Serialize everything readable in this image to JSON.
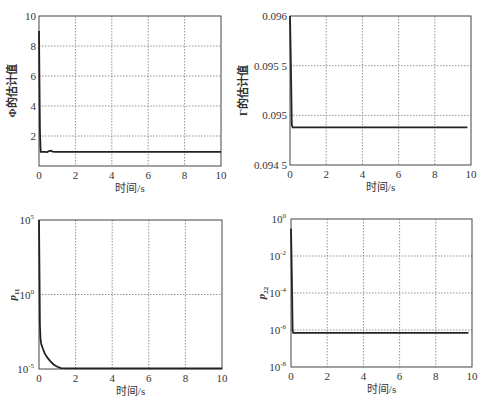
{
  "chart_data": [
    {
      "id": "phi",
      "type": "line",
      "title": "",
      "xlabel": "时间/s",
      "ylabel": "Φ的估计值",
      "xlim": [
        0,
        10
      ],
      "ylim": [
        0,
        10
      ],
      "yscale": "linear",
      "grid": true,
      "xticks": [
        0,
        2,
        4,
        6,
        8,
        10
      ],
      "xtick_labels": [
        "0",
        "2",
        "4",
        "6",
        "8",
        "10"
      ],
      "yticks": [
        2,
        4,
        6,
        8,
        10
      ],
      "ytick_labels": [
        "2",
        "4",
        "6",
        "8",
        "10"
      ],
      "series": [
        {
          "name": "Φ estimate",
          "x": [
            0,
            0.02,
            0.05,
            0.08,
            0.1,
            0.3,
            0.45,
            0.55,
            0.65,
            0.75,
            0.9,
            2,
            4,
            6,
            8,
            10
          ],
          "y": [
            9.0,
            6.0,
            2.5,
            1.2,
            0.95,
            0.95,
            0.93,
            1.0,
            1.02,
            0.96,
            0.95,
            0.95,
            0.95,
            0.95,
            0.95,
            0.95
          ]
        }
      ]
    },
    {
      "id": "gamma",
      "type": "line",
      "title": "",
      "xlabel": "时间/s",
      "ylabel": "Γ的估计值",
      "xlim": [
        0,
        10
      ],
      "ylim": [
        0.0945,
        0.096
      ],
      "yscale": "linear",
      "grid": true,
      "xticks": [
        0,
        2,
        4,
        6,
        8,
        10
      ],
      "xtick_labels": [
        "0",
        "2",
        "4",
        "6",
        "8",
        "10"
      ],
      "yticks": [
        0.0945,
        0.095,
        0.0955,
        0.096
      ],
      "ytick_labels": [
        "0.094 5",
        "0.095",
        "0.095 5",
        "0.096"
      ],
      "series": [
        {
          "name": "Γ estimate",
          "x": [
            0,
            0.05,
            0.1,
            0.15,
            2,
            4,
            6,
            8,
            9.8
          ],
          "y": [
            0.096,
            0.0955,
            0.0949,
            0.09488,
            0.09488,
            0.09488,
            0.09488,
            0.09488,
            0.09488
          ]
        }
      ]
    },
    {
      "id": "p11",
      "type": "line",
      "title": "",
      "xlabel": "时间/s",
      "ylabel": "p11",
      "ylabel_main": "p",
      "ylabel_sub": "11",
      "xlim": [
        0,
        10
      ],
      "ylim": [
        1e-05,
        100000.0
      ],
      "yscale": "log",
      "grid": true,
      "xticks": [
        0,
        2,
        4,
        6,
        8,
        10
      ],
      "xtick_labels": [
        "0",
        "2",
        "4",
        "6",
        "8",
        "10"
      ],
      "yticks": [
        1e-05,
        1.0,
        100000.0
      ],
      "ytick_base": [
        "10",
        "10",
        "10"
      ],
      "ytick_exp": [
        "-5",
        "0",
        "5"
      ],
      "series": [
        {
          "name": "p11",
          "x": [
            0,
            0.02,
            0.05,
            0.08,
            0.12,
            0.2,
            0.3,
            0.45,
            0.6,
            0.8,
            1.0,
            1.2,
            1.5,
            2,
            4,
            6,
            8,
            10
          ],
          "y": [
            100000.0,
            100.0,
            0.01,
            0.001,
            0.0005,
            0.00025,
            0.00012,
            6e-05,
            3.5e-05,
            2e-05,
            1.4e-05,
            1.15e-05,
            1.1e-05,
            1.1e-05,
            1.1e-05,
            1.1e-05,
            1.1e-05,
            1.1e-05
          ]
        }
      ]
    },
    {
      "id": "p22",
      "type": "line",
      "title": "",
      "xlabel": "时间/s",
      "ylabel": "p22",
      "ylabel_main": "p",
      "ylabel_sub": "22",
      "xlim": [
        0,
        10
      ],
      "ylim": [
        1e-08,
        1.0
      ],
      "yscale": "log",
      "grid": true,
      "xticks": [
        0,
        2,
        4,
        6,
        8,
        10
      ],
      "xtick_labels": [
        "0",
        "2",
        "4",
        "6",
        "8",
        "10"
      ],
      "yticks": [
        1e-08,
        1e-06,
        0.0001,
        0.01,
        1.0
      ],
      "ytick_base": [
        "10",
        "10",
        "10",
        "10",
        "10"
      ],
      "ytick_exp": [
        "-8",
        "-6",
        "-4",
        "-2",
        "0"
      ],
      "series": [
        {
          "name": "p22",
          "x": [
            0,
            0.03,
            0.06,
            0.09,
            0.12,
            2,
            4,
            6,
            8,
            9.8
          ],
          "y": [
            0.3,
            0.01,
            0.0001,
            1e-06,
            7e-07,
            7e-07,
            7e-07,
            7e-07,
            7e-07,
            7e-07
          ]
        }
      ]
    }
  ]
}
